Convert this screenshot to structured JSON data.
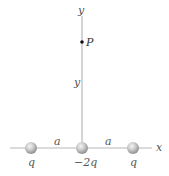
{
  "diagram": {
    "axes": {
      "x_label": "x",
      "y_label_top": "y"
    },
    "point": {
      "label": "P",
      "distance_label": "y"
    },
    "charges": [
      {
        "label": "q",
        "position": "left"
      },
      {
        "label": "−2q",
        "position": "origin"
      },
      {
        "label": "q",
        "position": "right"
      }
    ],
    "spacing_labels": [
      {
        "label": "a",
        "between": "left-origin"
      },
      {
        "label": "a",
        "between": "origin-right"
      }
    ],
    "colors": {
      "axis": "#b8b8b8",
      "charge_fill": "#c8c8c8",
      "charge_highlight": "#f2f2f2",
      "charge_shadow": "#8a8a8a",
      "point": "#111111",
      "text": "#555555"
    }
  }
}
